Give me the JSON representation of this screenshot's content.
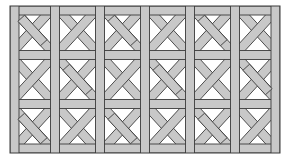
{
  "pattern": {
    "name": "woven diagonal lattice",
    "origin": [
      10,
      6
    ],
    "cols": 6,
    "rows": 3,
    "cell_width": 45,
    "cell_height": 49,
    "band_width": 9,
    "colors": {
      "background": "#ffffff",
      "band_fill": "#c8c8c8",
      "band_stroke": "#3a3a3a"
    }
  }
}
